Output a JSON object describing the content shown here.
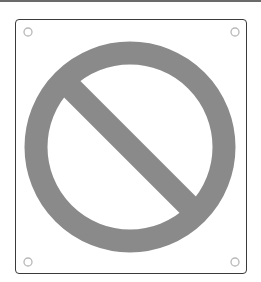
{
  "sign": {
    "symbol": "prohibition-icon",
    "description": "No / prohibited sign: circle with diagonal slash",
    "colors": {
      "symbol": "#8a8a8a",
      "frame_border": "#3a3a3a",
      "background": "#ffffff",
      "top_strip": "#6a6a6a",
      "mounting_hole": "#b8b8b8"
    },
    "mounting_holes": 4
  }
}
